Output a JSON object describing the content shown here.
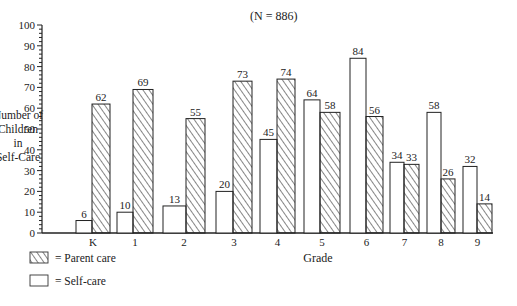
{
  "chart_data": {
    "type": "bar",
    "title": "(N = 886)",
    "title_italic_part": "N",
    "xlabel": "Grade",
    "ylabel": [
      "Number of",
      "Children",
      "in",
      "Self-Care"
    ],
    "ylim": [
      0,
      100
    ],
    "yticks": [
      0,
      10,
      20,
      30,
      40,
      50,
      60,
      70,
      80,
      90,
      100
    ],
    "categories": [
      "K",
      "1",
      "2",
      "3",
      "4",
      "5",
      "6",
      "7",
      "8",
      "9"
    ],
    "series": [
      {
        "name": "Self-care",
        "pattern": "none",
        "values": [
          6,
          10,
          13,
          20,
          45,
          64,
          84,
          34,
          58,
          32
        ]
      },
      {
        "name": "Parent care",
        "pattern": "hatched",
        "values": [
          62,
          69,
          55,
          73,
          74,
          58,
          56,
          33,
          26,
          14
        ]
      }
    ],
    "legend": {
      "placement": "bottom-left",
      "entries": [
        {
          "pattern": "hatched",
          "text": "= Parent care"
        },
        {
          "pattern": "none",
          "text": "= Self-care"
        }
      ]
    },
    "grid": false,
    "colors": {
      "stroke": "#222222",
      "background": "#ffffff"
    }
  }
}
